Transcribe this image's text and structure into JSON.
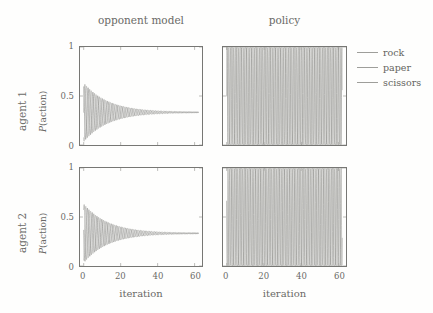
{
  "figure": {
    "clipped_top_caption": "",
    "column_titles": [
      "opponent model",
      "policy"
    ],
    "row_labels": [
      "agent 1",
      "agent 2"
    ],
    "y_axis_title_prefix": "P",
    "y_axis_title_suffix": "(action)",
    "x_axis_title": "iteration"
  },
  "legend": {
    "position": "right",
    "entries": [
      {
        "label": "rock",
        "color": "#8a8a87"
      },
      {
        "label": "paper",
        "color": "#8a8a87"
      },
      {
        "label": "scissors",
        "color": "#8a8a87"
      }
    ]
  },
  "axes": {
    "y_ticks": [
      "0",
      "0.5",
      "1"
    ],
    "y_tick_values": [
      0,
      0.5,
      1
    ],
    "x_ticks": [
      "0",
      "20",
      "40",
      "60"
    ],
    "x_tick_values": [
      0,
      20,
      40,
      60
    ],
    "xlim": [
      -2,
      64
    ],
    "ylim": [
      0,
      1
    ]
  },
  "chart_data": {
    "type": "line",
    "title": "",
    "subtitle": "",
    "xlabel": "iteration",
    "ylabel": "P(action)",
    "xlim": [
      -2,
      64
    ],
    "ylim": [
      0,
      1
    ],
    "grid": false,
    "legend_position": "right",
    "legend_entries": [
      "rock",
      "paper",
      "scissors"
    ],
    "xticks": [
      0,
      20,
      40,
      60
    ],
    "yticks": [
      0,
      0.5,
      1
    ],
    "panels": [
      {
        "row": "agent 1",
        "column": "opponent model",
        "description": "Damped oscillation of three action probabilities converging to the uniform mixed equilibrium 1/3.",
        "converges_to": 0.3333,
        "initial_amplitude": 0.3,
        "decay_rate": 0.075,
        "oscillation_period_iterations": 2.6,
        "phase_offsets_fraction": [
          0,
          0.3333,
          0.6667
        ],
        "series": [
          {
            "name": "rock",
            "color": "#8f8f8c",
            "start_value": 0.62,
            "end_value": 0.333
          },
          {
            "name": "paper",
            "color": "#7d7d7a",
            "start_value": 0.33,
            "end_value": 0.334
          },
          {
            "name": "scissors",
            "color": "#a0a09d",
            "start_value": 0.06,
            "end_value": 0.333
          }
        ]
      },
      {
        "row": "agent 1",
        "column": "policy",
        "description": "Sustained full-amplitude oscillation of the policy between 0 and 1 for all three actions, never converging.",
        "converges_to": null,
        "initial_amplitude": 0.5,
        "decay_rate": 0.0,
        "oscillation_period_iterations": 2.6,
        "phase_offsets_fraction": [
          0,
          0.3333,
          0.6667
        ],
        "series": [
          {
            "name": "rock",
            "color": "#8f8f8c",
            "min_value": 0.0,
            "max_value": 1.0
          },
          {
            "name": "paper",
            "color": "#7d7d7a",
            "min_value": 0.0,
            "max_value": 1.0
          },
          {
            "name": "scissors",
            "color": "#a0a09d",
            "min_value": 0.0,
            "max_value": 1.0
          }
        ]
      },
      {
        "row": "agent 2",
        "column": "opponent model",
        "description": "Damped oscillation of three action probabilities converging to the uniform mixed equilibrium 1/3.",
        "converges_to": 0.3333,
        "initial_amplitude": 0.3,
        "decay_rate": 0.075,
        "oscillation_period_iterations": 2.6,
        "phase_offsets_fraction": [
          0.15,
          0.4833,
          0.8167
        ],
        "series": [
          {
            "name": "rock",
            "color": "#8f8f8c",
            "start_value": 0.55,
            "end_value": 0.333
          },
          {
            "name": "paper",
            "color": "#7d7d7a",
            "start_value": 0.1,
            "end_value": 0.334
          },
          {
            "name": "scissors",
            "color": "#a0a09d",
            "start_value": 0.35,
            "end_value": 0.333
          }
        ]
      },
      {
        "row": "agent 2",
        "column": "policy",
        "description": "Sustained full-amplitude oscillation of the policy between 0 and 1 for all three actions, never converging.",
        "converges_to": null,
        "initial_amplitude": 0.5,
        "decay_rate": 0.0,
        "oscillation_period_iterations": 2.6,
        "phase_offsets_fraction": [
          0.15,
          0.4833,
          0.8167
        ],
        "series": [
          {
            "name": "rock",
            "color": "#8f8f8c",
            "min_value": 0.0,
            "max_value": 1.0
          },
          {
            "name": "paper",
            "color": "#7d7d7a",
            "min_value": 0.0,
            "max_value": 1.0
          },
          {
            "name": "scissors",
            "color": "#a0a09d",
            "min_value": 0.0,
            "max_value": 1.0
          }
        ]
      }
    ]
  }
}
